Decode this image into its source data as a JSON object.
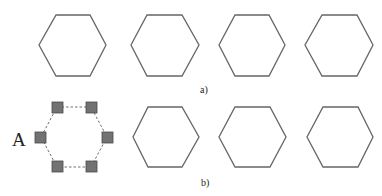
{
  "figure": {
    "panels": [
      {
        "label": "a)",
        "hexagons": [
          {
            "cx": 72,
            "cy": 45
          },
          {
            "cx": 165,
            "cy": 45
          },
          {
            "cx": 252,
            "cy": 45
          },
          {
            "cx": 339,
            "cy": 45
          }
        ]
      },
      {
        "label": "b)",
        "node_label": "A",
        "hexagons": [
          {
            "cx": 166,
            "cy": 137
          },
          {
            "cx": 252,
            "cy": 137
          },
          {
            "cx": 340,
            "cy": 137
          }
        ]
      }
    ],
    "colors": {
      "hexagon_stroke": "#666666",
      "square_fill": "#727272",
      "square_stroke": "#4a4a4a",
      "dashed_line": "#707070"
    }
  }
}
